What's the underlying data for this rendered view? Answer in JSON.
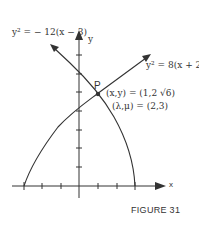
{
  "figure": {
    "caption": "FIGURE 31",
    "axis_x_label": "x",
    "axis_y_label": "y",
    "curve1_label": "y² = − 12(x − 3)",
    "curve2_label": "y² = 8(x + 2)",
    "point_label": "P",
    "point_coords": "(x,y) = (1,2 √6)",
    "lambda_mu": "(λ,μ) = (2,3)"
  },
  "colors": {
    "ink": "#333333"
  }
}
